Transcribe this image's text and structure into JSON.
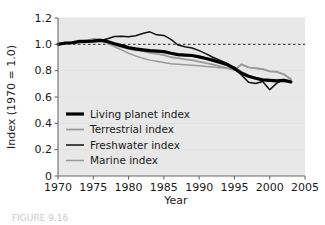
{
  "figure": {
    "caption": "FIGURE 9.16"
  },
  "chart_data": {
    "type": "line",
    "title": "",
    "xlabel": "Year",
    "ylabel": "Index (1970 = 1.0)",
    "xlim": [
      1970,
      2005
    ],
    "ylim": [
      0,
      1.2
    ],
    "xticks": [
      "1970",
      "1975",
      "1980",
      "1985",
      "1990",
      "1995",
      "2000",
      "2005"
    ],
    "xtick_values": [
      1970,
      1975,
      1980,
      1985,
      1990,
      1995,
      2000,
      2005
    ],
    "yticks": [
      "0",
      "0.2",
      "0.4",
      "0.6",
      "0.8",
      "1.0",
      "1.2"
    ],
    "ytick_values": [
      0,
      0.2,
      0.4,
      0.6,
      0.8,
      1.0,
      1.2
    ],
    "grid": false,
    "plot_background": "#e8e8e8",
    "legend_position": "lower left",
    "reference_line": {
      "y": 1.0,
      "style": "dashed",
      "color": "#4d4d4d"
    },
    "x": [
      1970,
      1971,
      1972,
      1973,
      1974,
      1975,
      1976,
      1977,
      1978,
      1979,
      1980,
      1981,
      1982,
      1983,
      1984,
      1985,
      1986,
      1987,
      1988,
      1989,
      1990,
      1991,
      1992,
      1993,
      1994,
      1995,
      1996,
      1997,
      1998,
      1999,
      2000,
      2001,
      2002,
      2003
    ],
    "series": [
      {
        "name": "Living planet index",
        "color": "#000000",
        "width": 3.2,
        "values": [
          1.0,
          1.01,
          1.012,
          1.02,
          1.022,
          1.025,
          1.03,
          1.022,
          1.005,
          0.99,
          0.975,
          0.965,
          0.958,
          0.952,
          0.948,
          0.945,
          0.932,
          0.922,
          0.918,
          0.915,
          0.905,
          0.892,
          0.878,
          0.862,
          0.845,
          0.818,
          0.782,
          0.758,
          0.742,
          0.73,
          0.726,
          0.722,
          0.726,
          0.715
        ]
      },
      {
        "name": "Terrestrial index",
        "color": "#9a9a9a",
        "width": 1.8,
        "values": [
          1.0,
          1.008,
          1.015,
          1.03,
          1.028,
          1.042,
          1.038,
          1.012,
          0.995,
          0.978,
          0.965,
          0.955,
          0.948,
          0.935,
          0.928,
          0.918,
          0.902,
          0.895,
          0.885,
          0.88,
          0.868,
          0.858,
          0.845,
          0.832,
          0.82,
          0.805,
          0.848,
          0.825,
          0.818,
          0.812,
          0.795,
          0.792,
          0.772,
          0.735
        ]
      },
      {
        "name": "Freshwater index",
        "color": "#111111",
        "width": 1.5,
        "values": [
          1.0,
          1.005,
          1.012,
          1.022,
          1.018,
          1.03,
          1.028,
          1.042,
          1.06,
          1.062,
          1.058,
          1.065,
          1.082,
          1.095,
          1.072,
          1.068,
          1.038,
          0.995,
          0.982,
          0.972,
          0.952,
          0.928,
          0.9,
          0.878,
          0.855,
          0.812,
          0.768,
          0.712,
          0.702,
          0.718,
          0.655,
          0.705,
          0.732,
          0.712
        ]
      },
      {
        "name": "Marine index",
        "color": "#9a9a9a",
        "width": 1.5,
        "values": [
          1.0,
          1.012,
          1.018,
          1.028,
          1.022,
          1.038,
          1.032,
          1.008,
          0.982,
          0.958,
          0.932,
          0.912,
          0.895,
          0.88,
          0.872,
          0.862,
          0.852,
          0.848,
          0.845,
          0.842,
          0.838,
          0.832,
          0.828,
          0.822,
          0.818,
          0.805,
          0.848,
          0.825,
          0.818,
          0.812,
          0.795,
          0.792,
          0.772,
          0.735
        ]
      }
    ]
  }
}
